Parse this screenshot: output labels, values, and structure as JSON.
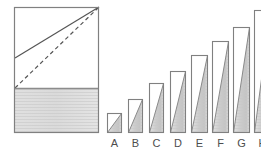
{
  "figure": {
    "title": "",
    "background_color": "#ffffff",
    "outline_color": "#808080",
    "fill_light": "#e8e8e8",
    "fill_mid": "#d2d2d2",
    "fill_dark": "#bdbdbd",
    "fill_white": "#ffffff",
    "line_color": "#555555",
    "label_color": "#4d4d4d"
  },
  "left_panel": {
    "name": "reference-rectangle",
    "x": 14,
    "y": 7,
    "width": 85,
    "height": 126,
    "divider_y": 88,
    "upper_region": {
      "name": "unshaded-upper-region",
      "fill": "#ffffff"
    },
    "lower_region": {
      "name": "shaded-lower-region",
      "fill": "#dcdcdc"
    },
    "solid_diagonal": {
      "name": "solid-diagonal-line",
      "x1": 15,
      "y1": 58,
      "x2": 99,
      "y2": 7,
      "style": "solid"
    },
    "dashed_diagonal": {
      "name": "dashed-diagonal-line",
      "x1": 15,
      "y1": 88,
      "x2": 99,
      "y2": 7,
      "style": "dashed"
    }
  },
  "chart_data": {
    "type": "bar",
    "title": "",
    "xlabel": "",
    "ylabel": "",
    "grid": false,
    "legend": "none",
    "baseline_y": 133,
    "categories": [
      "A",
      "B",
      "C",
      "D",
      "E",
      "F",
      "G",
      "H"
    ],
    "values": [
      20,
      34,
      50,
      62,
      78,
      92,
      106,
      123
    ],
    "ylim": [
      0,
      126
    ],
    "bars": [
      {
        "label": "A",
        "x": 107,
        "width": 15,
        "top": 113,
        "height": 20
      },
      {
        "label": "B",
        "x": 128,
        "width": 15,
        "top": 99,
        "height": 34
      },
      {
        "label": "C",
        "x": 149,
        "width": 15,
        "top": 83,
        "height": 50
      },
      {
        "label": "D",
        "x": 170,
        "width": 16,
        "top": 71,
        "height": 62
      },
      {
        "label": "E",
        "x": 191,
        "width": 17,
        "top": 55,
        "height": 78
      },
      {
        "label": "F",
        "x": 212,
        "width": 17,
        "top": 41,
        "height": 92
      },
      {
        "label": "G",
        "x": 233,
        "width": 17,
        "top": 27,
        "height": 106
      },
      {
        "label": "H",
        "x": 254,
        "width": 17,
        "top": 10,
        "height": 123
      }
    ]
  }
}
